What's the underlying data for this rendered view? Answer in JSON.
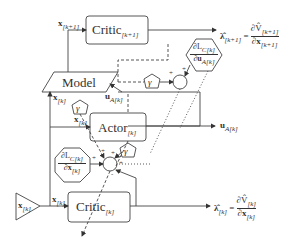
{
  "diagram": {
    "title": "",
    "blocks": {
      "critic_next": {
        "label": "Critic",
        "subscript": "[k+1]"
      },
      "model": {
        "label": "Model"
      },
      "actor": {
        "label": "Actor",
        "subscript": "[k]"
      },
      "critic_curr": {
        "label": "Critic",
        "subscript": "[k]"
      }
    },
    "signals": {
      "x_next": {
        "label": "x",
        "subscript": "[k+1]"
      },
      "x_k_model": {
        "label": "x",
        "subscript": "[k]"
      },
      "u_model": {
        "label": "u",
        "subscript": "A[k]"
      },
      "x_k_actor": {
        "label": "x",
        "subscript": "[k]"
      },
      "u_out": {
        "label": "u",
        "subscript": "A[k]"
      },
      "x_k_critic": {
        "label": "x",
        "subscript": "[k]"
      },
      "x_k_input": {
        "label": "x",
        "subscript": "[k]"
      }
    },
    "outputs": {
      "lambda_next": {
        "lhs": "λ̂",
        "lhs_sub": "[k+1]",
        "eq": "=",
        "num": "∂V̂",
        "num_sub": "[k+1]",
        "den": "∂x",
        "den_sub": "[k+1]"
      },
      "lambda_curr": {
        "lhs": "λ̂",
        "lhs_sub": "[k]",
        "eq": "=",
        "num": "∂V̂",
        "num_sub": "[k]",
        "den": "∂x",
        "den_sub": "[k]"
      }
    },
    "hexagons": {
      "dLc_du": {
        "num": "∂L",
        "num_sub": "C[k]",
        "den": "∂u",
        "den_sub": "A[k]"
      },
      "dLc_dx": {
        "num": "∂L",
        "num_sub": "C[k]",
        "den": "∂x",
        "den_sub": "[k]"
      }
    },
    "gains": {
      "gamma": "γ"
    },
    "summers": {
      "plus": "+",
      "minus": "-"
    }
  }
}
